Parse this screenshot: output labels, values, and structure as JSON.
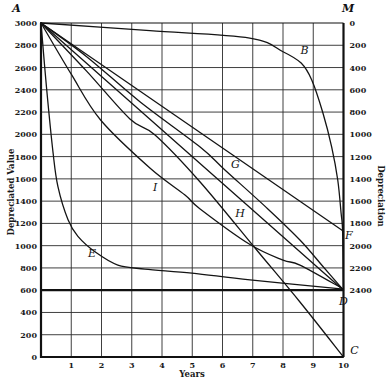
{
  "chart_data": {
    "type": "line",
    "title": "",
    "xlabel": "Years",
    "ylabel": "Depreciated Value",
    "ylabel_right": "Depreciation",
    "xlim": [
      0,
      10
    ],
    "ylim": [
      0,
      3000
    ],
    "grid": true,
    "x_ticks": [
      1,
      2,
      3,
      4,
      5,
      6,
      7,
      8,
      9,
      10
    ],
    "y_ticks": [
      0,
      200,
      400,
      600,
      800,
      1000,
      1200,
      1400,
      1600,
      1800,
      2000,
      2200,
      2400,
      2600,
      2800,
      3000
    ],
    "y_right_ticks": [
      0,
      200,
      400,
      600,
      800,
      1000,
      1200,
      1400,
      1600,
      1800,
      2000,
      2200,
      2400
    ],
    "salvage_value": 600,
    "series": [
      {
        "name": "A-B-D",
        "label": "B",
        "points": [
          [
            0,
            3000
          ],
          [
            3.6,
            2931
          ],
          [
            6.9,
            2865
          ],
          [
            8.0,
            2742
          ],
          [
            8.6,
            2640
          ],
          [
            8.95,
            2488
          ],
          [
            9.32,
            2192
          ],
          [
            9.61,
            1886
          ],
          [
            9.81,
            1590
          ],
          [
            9.92,
            1293
          ],
          [
            9.97,
            1130
          ],
          [
            10,
            610
          ]
        ]
      },
      {
        "name": "A-F",
        "label": "F",
        "points": [
          [
            0,
            3000
          ],
          [
            10,
            1130
          ]
        ]
      },
      {
        "name": "A-G-D",
        "label": "G",
        "points": [
          [
            0,
            3000
          ],
          [
            1.5,
            2700
          ],
          [
            3.27,
            2293
          ],
          [
            5.26,
            1886
          ],
          [
            6.08,
            1680
          ],
          [
            7.5,
            1330
          ],
          [
            8.56,
            1051
          ],
          [
            9.3,
            820
          ],
          [
            10,
            600
          ]
        ]
      },
      {
        "name": "A-D",
        "label": "",
        "points": [
          [
            0,
            3000
          ],
          [
            10,
            600
          ]
        ]
      },
      {
        "name": "A-H-C",
        "label": "H",
        "points": [
          [
            0,
            3000
          ],
          [
            1.5,
            2570
          ],
          [
            2.94,
            2138
          ],
          [
            3.77,
            1994
          ],
          [
            5.26,
            1572
          ],
          [
            7.13,
            961
          ],
          [
            8.56,
            494
          ],
          [
            10,
            0
          ]
        ]
      },
      {
        "name": "A-I-D",
        "label": "I",
        "points": [
          [
            0,
            3000
          ],
          [
            1.0,
            2540
          ],
          [
            1.97,
            2129
          ],
          [
            3.6,
            1698
          ],
          [
            4.76,
            1455
          ],
          [
            5.26,
            1330
          ],
          [
            6.91,
            1010
          ],
          [
            8.0,
            870
          ],
          [
            8.56,
            826
          ],
          [
            10,
            610
          ]
        ]
      },
      {
        "name": "A-E-D",
        "label": "E",
        "points": [
          [
            0,
            3000
          ],
          [
            0.18,
            2428
          ],
          [
            0.4,
            1832
          ],
          [
            0.56,
            1530
          ],
          [
            0.89,
            1235
          ],
          [
            1.22,
            1084
          ],
          [
            1.82,
            938
          ],
          [
            2.54,
            826
          ],
          [
            3.43,
            790
          ],
          [
            4.99,
            754
          ],
          [
            6.91,
            692
          ],
          [
            10,
            610
          ]
        ]
      }
    ],
    "annotations": [
      {
        "text": "A",
        "x": -0.95,
        "y": 3095
      },
      {
        "text": "M",
        "x": 9.95,
        "y": 3095
      },
      {
        "text": "B",
        "x": 8.58,
        "y": 2720
      },
      {
        "text": "F",
        "x": 10.05,
        "y": 1060
      },
      {
        "text": "D",
        "x": 9.85,
        "y": 470
      },
      {
        "text": "C",
        "x": 10.22,
        "y": 30
      },
      {
        "text": "E",
        "x": 1.55,
        "y": 900
      },
      {
        "text": "G",
        "x": 6.28,
        "y": 1700
      },
      {
        "text": "H",
        "x": 6.42,
        "y": 1255
      },
      {
        "text": "I",
        "x": 3.7,
        "y": 1490
      }
    ]
  }
}
